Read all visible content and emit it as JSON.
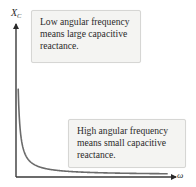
{
  "diagram": {
    "y_axis": {
      "symbol": "X",
      "subscript": "C"
    },
    "x_axis": {
      "symbol": "ω"
    },
    "curve": {
      "relation": "X_C = 1/(ωC)",
      "shape": "hyperbolic decay",
      "color": "#6b6b6b"
    },
    "axis_color": "#3a3a3a",
    "callouts": [
      {
        "id": "low",
        "lines": [
          "Low angular frequency",
          "means large capacitive",
          "reactance."
        ]
      },
      {
        "id": "high",
        "lines": [
          "High angular frequency",
          "means small capacitive",
          "reactance."
        ]
      }
    ]
  }
}
